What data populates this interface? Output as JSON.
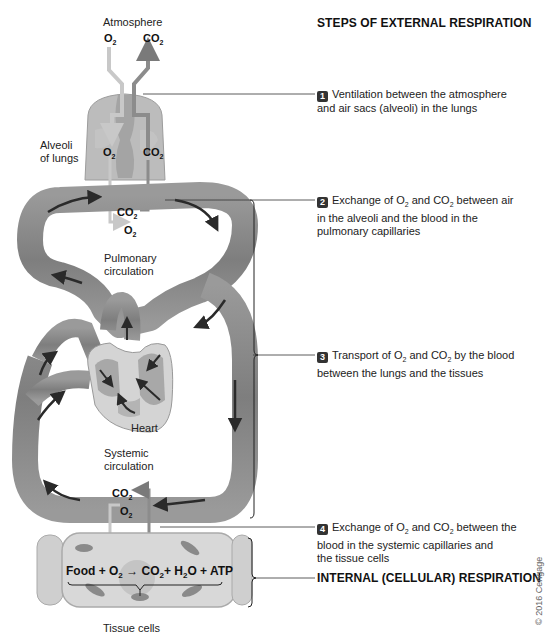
{
  "title": "STEPS OF EXTERNAL RESPIRATION",
  "labels": {
    "atmosphere": "Atmosphere",
    "alveoli_line1": "Alveoli",
    "alveoli_line2": "of lungs",
    "pulmonary_line1": "Pulmonary",
    "pulmonary_line2": "circulation",
    "heart": "Heart",
    "systemic_line1": "Systemic",
    "systemic_line2": "circulation",
    "tissue_cells": "Tissue cells"
  },
  "gases": {
    "o2": "O",
    "co2": "CO",
    "sub": "2"
  },
  "steps": [
    {
      "number": "1",
      "text_line1": "Ventilation between the atmosphere",
      "text_line2": "and air sacs (alveoli) in the lungs"
    },
    {
      "number": "2",
      "pre": "Exchange of O",
      "mid": " and CO",
      "post": " between air",
      "text_line2": "in the alveoli and the blood in the",
      "text_line3": "pulmonary capillaries"
    },
    {
      "number": "3",
      "pre": "Transport of O",
      "mid": " and CO",
      "post": " by the blood",
      "text_line2": "between the lungs and the tissues"
    },
    {
      "number": "4",
      "pre": "Exchange of O",
      "mid": " and CO",
      "post": " between the",
      "text_line2": "blood in the systemic capillaries and",
      "text_line3": "the tissue cells"
    }
  ],
  "internal_respiration": "INTERNAL (CELLULAR) RESPIRATION",
  "equation": {
    "food": "Food + O",
    "arrow": " → ",
    "co2": "CO",
    "h2o_pre": "+ H",
    "h2o_post": "O + ATP",
    "sub": "2"
  },
  "copyright": "© 2016 Cengage",
  "colors": {
    "vessel": "#8a8a8a",
    "vessel_dark": "#6e6e6e",
    "lung": "#b9b9b9",
    "o2_arrow": "#c8c8c8",
    "co2_arrow": "#8c8c8c",
    "cell": "#d6d6d6",
    "text": "#222222"
  }
}
